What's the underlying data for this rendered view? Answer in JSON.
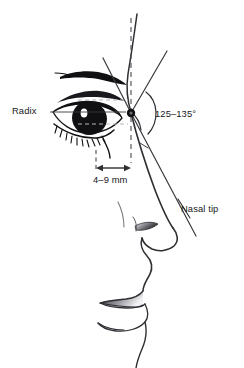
{
  "figure": {
    "type": "anatomical-line-diagram",
    "background_color": "#ffffff",
    "ink_color": "#17171a",
    "line_color": "#3a3a3f",
    "guide_color": "#5a5a60"
  },
  "labels": {
    "radix": "Radix",
    "angle": "125–135°",
    "distance": "4–9 mm",
    "nasal_tip": "Nasal tip"
  },
  "annotations": {
    "radix_point": {
      "x": 131,
      "y": 113,
      "name": "radix-vertex"
    },
    "nasal_tip_point": {
      "x": 172,
      "y": 228,
      "name": "nasal-tip-point"
    },
    "nasofrontal_angle_range_degrees": [
      125,
      135
    ],
    "radix_projection_range_mm": [
      4,
      9
    ],
    "leader_lines": {
      "radix_leader": "horizontal line from 'Radix' text rightward to radix point",
      "nasal_tip_leader": "short diagonal line from 'Nasal tip' text to nasal tip"
    },
    "measurement_arrow": {
      "orientation": "horizontal",
      "double_headed": true,
      "from_x": 96,
      "to_x": 130,
      "y": 168
    },
    "dashed_guides": [
      "vertical facial plane line through radix",
      "short vertical dash at anterior corneal plane",
      "short vertical dash at radix plane"
    ]
  },
  "facial_features": [
    "forehead",
    "eyebrow",
    "upper eyelid",
    "eye with iris and highlight",
    "eyelashes",
    "cheek",
    "nasal dorsum",
    "nasal tip",
    "nostril",
    "columella",
    "upper lip",
    "lower lip",
    "chin"
  ]
}
